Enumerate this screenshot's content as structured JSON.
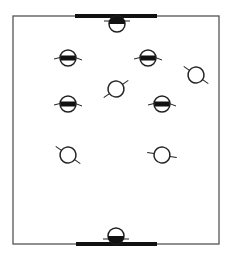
{
  "diagram": {
    "type": "tactical-field",
    "colors": {
      "line": "#222222",
      "field_border": "#555555",
      "fill": "#111111",
      "background": "#ffffff"
    },
    "field": {
      "x": 13,
      "y": 16,
      "width": 206,
      "height": 228
    },
    "goals": [
      {
        "id": "top-goal",
        "x1": 75,
        "x2": 157,
        "y": 16
      },
      {
        "id": "bottom-goal",
        "x1": 76,
        "x2": 157,
        "y": 244
      }
    ],
    "goalkeepers": [
      {
        "id": "goalkeeper-top",
        "cx": 117,
        "cy": 24,
        "filled_half": "top"
      },
      {
        "id": "goalkeeper-bottom",
        "cx": 116,
        "cy": 236,
        "filled_half": "bottom"
      }
    ],
    "team_banded": [
      {
        "id": "banded-player-1",
        "cx": 68,
        "cy": 58
      },
      {
        "id": "banded-player-2",
        "cx": 148,
        "cy": 58
      },
      {
        "id": "banded-player-3",
        "cx": 68,
        "cy": 104
      },
      {
        "id": "banded-player-4",
        "cx": 162,
        "cy": 104
      }
    ],
    "team_plain": [
      {
        "id": "plain-player-1",
        "cx": 196,
        "cy": 75,
        "stick_angle": 35
      },
      {
        "id": "plain-player-2",
        "cx": 116,
        "cy": 89,
        "stick_angle": -35
      },
      {
        "id": "plain-player-3",
        "cx": 68,
        "cy": 155,
        "stick_angle": 35
      },
      {
        "id": "plain-player-4",
        "cx": 162,
        "cy": 155,
        "stick_angle": 10
      }
    ]
  }
}
